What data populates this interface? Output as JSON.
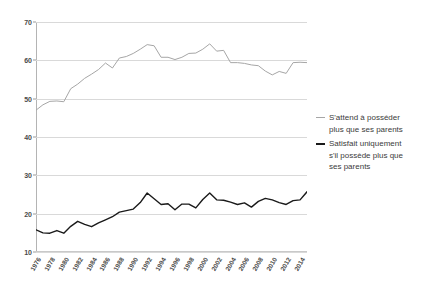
{
  "figure": {
    "title_partial": "",
    "background": "#ffffff"
  },
  "legend": {
    "position": "right",
    "entries": [
      {
        "label": "S'attend à posséder plus que ses parents",
        "lines": [
          "S'attend à posséder",
          "plus que ses parents"
        ],
        "color": "#a6a6a6",
        "swatch": "line-swatch-gray",
        "weight": "thin"
      },
      {
        "label": "Satisfait uniquement s'il possède plus que ses parents",
        "lines": [
          "Satisfait uniquement",
          "s'il possède plus que",
          "ses parents"
        ],
        "color": "#1a1a1a",
        "swatch": "line-swatch-black",
        "weight": "thick"
      }
    ]
  },
  "chart_data": {
    "type": "line",
    "title": "",
    "xlabel": "",
    "ylabel": "",
    "ylim": [
      10,
      70
    ],
    "yticks": [
      10,
      20,
      30,
      40,
      50,
      60,
      70
    ],
    "xlim": [
      1976,
      2015
    ],
    "xticks": [
      1976,
      1978,
      1980,
      1982,
      1984,
      1986,
      1988,
      1990,
      1992,
      1994,
      1996,
      1998,
      2000,
      2002,
      2004,
      2006,
      2008,
      2010,
      2012,
      2014
    ],
    "xtick_labels": [
      "1976",
      "1978",
      "1980",
      "1982",
      "1984",
      "1986",
      "1988",
      "1990",
      "1992",
      "1994",
      "1996",
      "1998",
      "2000",
      "2002",
      "2004",
      "2006",
      "2008",
      "2010",
      "2012",
      "2014"
    ],
    "xtick_rotation": -60,
    "grid": "horizontal",
    "legend_position": "right",
    "x": [
      1976,
      1977,
      1978,
      1979,
      1980,
      1981,
      1982,
      1983,
      1984,
      1985,
      1986,
      1987,
      1988,
      1989,
      1990,
      1991,
      1992,
      1993,
      1994,
      1995,
      1996,
      1997,
      1998,
      1999,
      2000,
      2001,
      2002,
      2003,
      2004,
      2005,
      2006,
      2007,
      2008,
      2009,
      2010,
      2011,
      2012,
      2013,
      2014,
      2015
    ],
    "series": [
      {
        "name": "S'attend à posséder plus que ses parents",
        "color": "#a6a6a6",
        "width": 1,
        "values": [
          47.0,
          48.4,
          49.3,
          49.4,
          49.2,
          52.6,
          53.8,
          55.3,
          56.4,
          57.6,
          59.3,
          58.0,
          60.6,
          61.0,
          61.8,
          62.9,
          64.1,
          63.8,
          60.8,
          60.8,
          60.2,
          60.8,
          61.8,
          61.9,
          62.9,
          64.3,
          62.4,
          62.6,
          59.4,
          59.4,
          59.2,
          58.8,
          58.6,
          57.2,
          56.2,
          57.1,
          56.6,
          59.4,
          59.5,
          59.4
        ]
      },
      {
        "name": "Satisfait uniquement s'il possède plus que ses parents",
        "color": "#1a1a1a",
        "width": 1.4,
        "values": [
          15.8,
          15.0,
          14.9,
          15.6,
          14.9,
          16.7,
          18.0,
          17.2,
          16.6,
          17.6,
          18.4,
          19.2,
          20.4,
          20.8,
          21.2,
          22.9,
          25.4,
          23.9,
          22.4,
          22.6,
          21.0,
          22.5,
          22.5,
          21.5,
          23.7,
          25.4,
          23.6,
          23.5,
          23.0,
          22.4,
          22.8,
          21.7,
          23.2,
          24.0,
          23.6,
          22.9,
          22.4,
          23.4,
          23.6,
          25.7
        ]
      }
    ]
  }
}
